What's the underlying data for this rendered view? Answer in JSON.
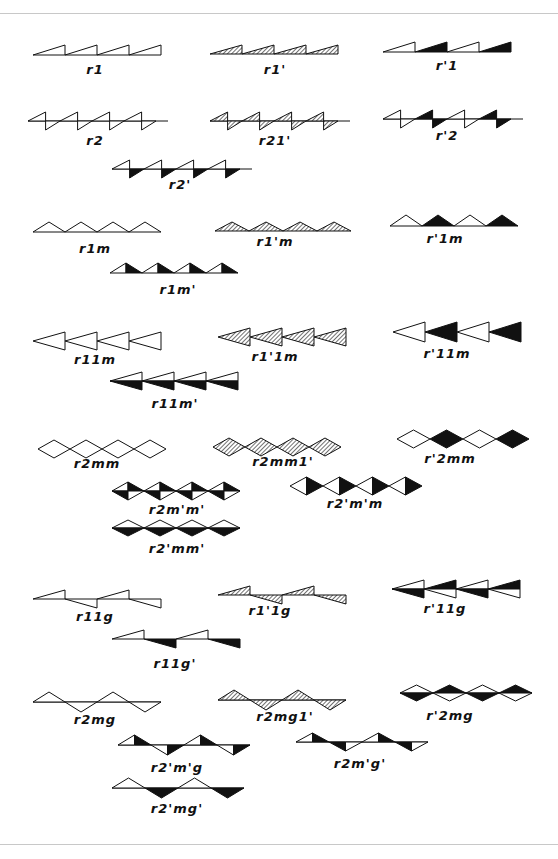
{
  "colors": {
    "ink": "#111111",
    "hatch": "#111111",
    "paper": "#ffffff",
    "rule": "#c8c8c8"
  },
  "bands": [
    {
      "id": "r1",
      "label": "r1",
      "x": 33,
      "y": 45,
      "lx": 95,
      "ly": 66
    },
    {
      "id": "r1p",
      "label": "r1'",
      "x": 210,
      "y": 45,
      "lx": 275,
      "ly": 66
    },
    {
      "id": "rp1",
      "label": "r'1",
      "x": 383,
      "y": 42,
      "lx": 447,
      "ly": 62
    },
    {
      "id": "r2",
      "label": "r2",
      "x": 28,
      "y": 112,
      "lx": 95,
      "ly": 137
    },
    {
      "id": "r21p",
      "label": "r21'",
      "x": 210,
      "y": 112,
      "lx": 275,
      "ly": 137
    },
    {
      "id": "rp2",
      "label": "r'2",
      "x": 383,
      "y": 110,
      "lx": 447,
      "ly": 132
    },
    {
      "id": "r2p",
      "label": "r2'",
      "x": 112,
      "y": 160,
      "lx": 180,
      "ly": 181
    },
    {
      "id": "r1m",
      "label": "r1m",
      "x": 33,
      "y": 222,
      "lx": 95,
      "ly": 245
    },
    {
      "id": "r1pm",
      "label": "r1'm",
      "x": 215,
      "y": 222,
      "lx": 275,
      "ly": 238
    },
    {
      "id": "rp1m",
      "label": "r'1m",
      "x": 390,
      "y": 215,
      "lx": 445,
      "ly": 235
    },
    {
      "id": "r1mp",
      "label": "r1m'",
      "x": 110,
      "y": 263,
      "lx": 178,
      "ly": 286
    },
    {
      "id": "r11m",
      "label": "r11m",
      "x": 33,
      "y": 332,
      "lx": 95,
      "ly": 356
    },
    {
      "id": "r1p1m",
      "label": "r1'1m",
      "x": 218,
      "y": 328,
      "lx": 275,
      "ly": 353
    },
    {
      "id": "rp11m",
      "label": "r'11m",
      "x": 393,
      "y": 322,
      "lx": 447,
      "ly": 350
    },
    {
      "id": "r11mp",
      "label": "r11m'",
      "x": 110,
      "y": 372,
      "lx": 175,
      "ly": 400
    },
    {
      "id": "r2mm",
      "label": "r2mm",
      "x": 38,
      "y": 440,
      "lx": 97,
      "ly": 460
    },
    {
      "id": "r2mm1p",
      "label": "r2mm1'",
      "x": 213,
      "y": 438,
      "lx": 283,
      "ly": 458
    },
    {
      "id": "rp2mm",
      "label": "r'2mm",
      "x": 397,
      "y": 430,
      "lx": 450,
      "ly": 455
    },
    {
      "id": "r2mpmp",
      "label": "r2m'm'",
      "x": 112,
      "y": 482,
      "lx": 177,
      "ly": 506
    },
    {
      "id": "r2pmpm",
      "label": "r2'm'm",
      "x": 290,
      "y": 477,
      "lx": 355,
      "ly": 500
    },
    {
      "id": "r2pmmp",
      "label": "r2'mm'",
      "x": 112,
      "y": 520,
      "lx": 177,
      "ly": 545
    },
    {
      "id": "r11g",
      "label": "r11g",
      "x": 33,
      "y": 590,
      "lx": 95,
      "ly": 613
    },
    {
      "id": "r1p1g",
      "label": "r1'1g",
      "x": 218,
      "y": 586,
      "lx": 270,
      "ly": 607
    },
    {
      "id": "rp11g",
      "label": "r'11g",
      "x": 392,
      "y": 580,
      "lx": 445,
      "ly": 605
    },
    {
      "id": "r11gp",
      "label": "r11g'",
      "x": 112,
      "y": 630,
      "lx": 175,
      "ly": 660
    },
    {
      "id": "r2mg",
      "label": "r2mg",
      "x": 33,
      "y": 692,
      "lx": 95,
      "ly": 716
    },
    {
      "id": "r2mg1p",
      "label": "r2mg1'",
      "x": 218,
      "y": 690,
      "lx": 285,
      "ly": 713
    },
    {
      "id": "rp2mg",
      "label": "r'2mg",
      "x": 400,
      "y": 685,
      "lx": 450,
      "ly": 712
    },
    {
      "id": "r2pmpg",
      "label": "r2'm'g",
      "x": 118,
      "y": 735,
      "lx": 177,
      "ly": 764
    },
    {
      "id": "r2mpgp",
      "label": "r2m'g'",
      "x": 296,
      "y": 733,
      "lx": 360,
      "ly": 760
    },
    {
      "id": "r2pmgp",
      "label": "r2'mg'",
      "x": 112,
      "y": 778,
      "lx": 177,
      "ly": 805
    }
  ]
}
